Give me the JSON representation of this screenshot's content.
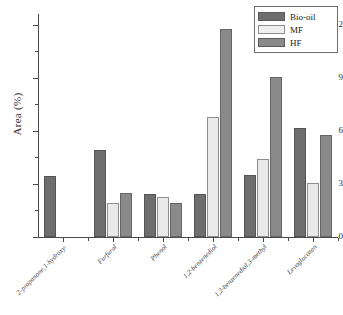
{
  "chart_data": {
    "type": "bar",
    "title": "",
    "xlabel": "",
    "ylabel": "Area (%)",
    "ylim": [
      0,
      12.6
    ],
    "grid": false,
    "legend_position": "top-right",
    "categories": [
      "2-propanone,1-hydroxy-",
      "Furfural",
      "Phenol",
      "1,2-benzenediol",
      "1,2-benzenediol,3-methyl",
      "Levoglucosan"
    ],
    "series": [
      {
        "name": "Bio-oil",
        "color": "#6e6e6e",
        "values": [
          3.45,
          4.9,
          2.45,
          2.45,
          3.5,
          6.15
        ]
      },
      {
        "name": "MF",
        "color": "#e9e9e9",
        "values": [
          null,
          1.9,
          2.25,
          6.8,
          4.4,
          3.05
        ]
      },
      {
        "name": "HF",
        "color": "#8a8a8a",
        "values": [
          null,
          2.5,
          1.95,
          11.75,
          9.05,
          5.75
        ]
      }
    ],
    "y_major_ticks": [
      0,
      3,
      6,
      9,
      12
    ],
    "y_minor_ticks": [
      1.5,
      4.5,
      7.5,
      10.5
    ],
    "y_tick_labels": [
      "0",
      "3",
      "6",
      "9",
      "12"
    ]
  }
}
